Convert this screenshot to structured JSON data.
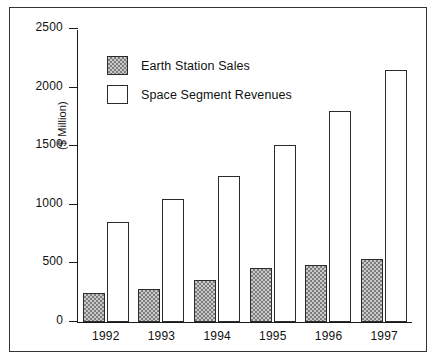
{
  "chart_data": {
    "type": "bar",
    "title": "",
    "xlabel": "",
    "ylabel": "($ Million)",
    "categories": [
      "1992",
      "1993",
      "1994",
      "1995",
      "1996",
      "1997"
    ],
    "series": [
      {
        "name": "Earth Station Sales",
        "values": [
          250,
          280,
          360,
          460,
          490,
          540
        ],
        "fill": "hatched-gray",
        "color": "#c9c9c9"
      },
      {
        "name": "Space Segment Revenues",
        "values": [
          850,
          1050,
          1250,
          1510,
          1800,
          2150
        ],
        "fill": "white",
        "color": "#ffffff"
      }
    ],
    "ylim": [
      0,
      2500
    ],
    "yticks": [
      0,
      500,
      1000,
      1500,
      2000,
      2500
    ],
    "ytick_labels": [
      "0",
      "500",
      "1000",
      "1500",
      "2000",
      "2500"
    ],
    "grid": false,
    "legend_position": "upper-left-inside",
    "axis_color": "#1a1a1a",
    "frame": true
  }
}
